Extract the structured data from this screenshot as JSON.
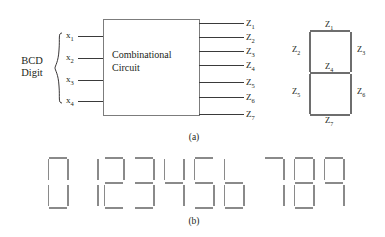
{
  "figure": {
    "part_a": {
      "caption": "(a)",
      "input_group_label_line1": "BCD",
      "input_group_label_line2": "Digit",
      "inputs": [
        {
          "label": "x",
          "sub": "1"
        },
        {
          "label": "x",
          "sub": "2"
        },
        {
          "label": "x",
          "sub": "3"
        },
        {
          "label": "x",
          "sub": "4"
        }
      ],
      "block_line1": "Combinational",
      "block_line2": "Circuit",
      "outputs": [
        {
          "label": "Z",
          "sub": "1"
        },
        {
          "label": "Z",
          "sub": "2"
        },
        {
          "label": "Z",
          "sub": "3"
        },
        {
          "label": "Z",
          "sub": "4"
        },
        {
          "label": "Z",
          "sub": "5"
        },
        {
          "label": "Z",
          "sub": "6"
        },
        {
          "label": "Z",
          "sub": "7"
        }
      ],
      "segment_reference": {
        "top": {
          "label": "Z",
          "sub": "1"
        },
        "top_left": {
          "label": "Z",
          "sub": "2"
        },
        "top_right": {
          "label": "Z",
          "sub": "3"
        },
        "middle": {
          "label": "Z",
          "sub": "4"
        },
        "bottom_left": {
          "label": "Z",
          "sub": "5"
        },
        "bottom_right": {
          "label": "Z",
          "sub": "6"
        },
        "bottom": {
          "label": "Z",
          "sub": "7"
        }
      }
    },
    "part_b": {
      "caption": "(b)",
      "digits": [
        {
          "value": "0",
          "segments": {
            "a": 1,
            "b": 1,
            "c": 1,
            "d": 1,
            "e": 1,
            "f": 1,
            "g": 0
          }
        },
        {
          "value": "1",
          "segments": {
            "a": 0,
            "b": 1,
            "c": 1,
            "d": 0,
            "e": 0,
            "f": 0,
            "g": 0
          }
        },
        {
          "value": "2",
          "segments": {
            "a": 1,
            "b": 1,
            "c": 0,
            "d": 1,
            "e": 1,
            "f": 0,
            "g": 1
          }
        },
        {
          "value": "3",
          "segments": {
            "a": 1,
            "b": 1,
            "c": 1,
            "d": 1,
            "e": 0,
            "f": 0,
            "g": 1
          }
        },
        {
          "value": "4",
          "segments": {
            "a": 0,
            "b": 1,
            "c": 1,
            "d": 0,
            "e": 0,
            "f": 1,
            "g": 1
          }
        },
        {
          "value": "5",
          "segments": {
            "a": 1,
            "b": 0,
            "c": 1,
            "d": 1,
            "e": 0,
            "f": 1,
            "g": 1
          }
        },
        {
          "value": "6",
          "segments": {
            "a": 0,
            "b": 0,
            "c": 1,
            "d": 1,
            "e": 1,
            "f": 1,
            "g": 1
          }
        },
        {
          "value": "7",
          "segments": {
            "a": 1,
            "b": 1,
            "c": 1,
            "d": 0,
            "e": 0,
            "f": 0,
            "g": 0
          }
        },
        {
          "value": "8",
          "segments": {
            "a": 1,
            "b": 1,
            "c": 1,
            "d": 1,
            "e": 1,
            "f": 1,
            "g": 1
          }
        },
        {
          "value": "9",
          "segments": {
            "a": 1,
            "b": 1,
            "c": 1,
            "d": 0,
            "e": 0,
            "f": 1,
            "g": 1
          }
        }
      ]
    }
  },
  "colors": {
    "ink": "#231f20",
    "rule": "#7c7c7c",
    "wire": "#3a3a3a",
    "segment": "#8a8a8a",
    "background": "#ffffff"
  }
}
